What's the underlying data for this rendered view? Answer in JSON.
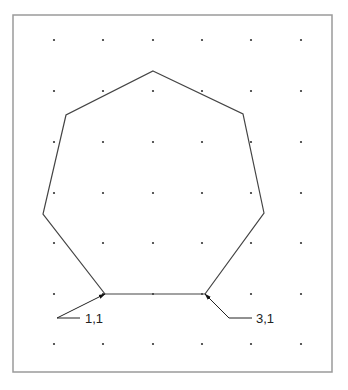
{
  "diagram": {
    "frame": {
      "x": 13,
      "y": 15,
      "w": 319,
      "h": 357,
      "stroke": "#9a9a9a"
    },
    "grid": {
      "xs": [
        54,
        103,
        153,
        202,
        251,
        301
      ],
      "ys": [
        40,
        91,
        142,
        193,
        243,
        294,
        344
      ],
      "dot_color": "#333333"
    },
    "heptagon": {
      "stroke": "#444444",
      "points": [
        [
          153,
          71
        ],
        [
          243,
          114
        ],
        [
          264,
          213
        ],
        [
          205,
          294
        ],
        [
          105,
          294
        ],
        [
          43,
          214
        ],
        [
          66,
          115
        ]
      ]
    },
    "labels": [
      {
        "text": "1,1",
        "x": 85,
        "y": 323,
        "leader": [
          [
            80,
            318
          ],
          [
            57,
            318
          ],
          [
            105,
            294
          ]
        ]
      },
      {
        "text": "3,1",
        "x": 256,
        "y": 323,
        "leader": [
          [
            252,
            318
          ],
          [
            229,
            318
          ],
          [
            205,
            294
          ]
        ]
      }
    ]
  }
}
